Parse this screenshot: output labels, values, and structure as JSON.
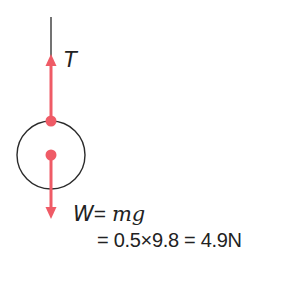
{
  "diagram": {
    "colors": {
      "force": "#ef5b66",
      "outline": "#2b2b2b",
      "text": "#222222"
    },
    "string": {
      "x": 51,
      "y1": 17,
      "y2": 60
    },
    "ball": {
      "cx": 51,
      "cy": 155,
      "r": 34
    },
    "forces": [
      {
        "name": "tension",
        "symbol": "T",
        "from": [
          51,
          121
        ],
        "to": [
          51,
          55
        ],
        "direction": "up"
      },
      {
        "name": "weight",
        "symbol": "W",
        "from": [
          51,
          155
        ],
        "to": [
          51,
          218
        ],
        "direction": "down"
      }
    ],
    "labels": {
      "tension": "T",
      "weight_symbol": "W",
      "weight_eq1": "= ",
      "weight_mg": "mg",
      "weight_eq2": "= 0.5×9.8 = 4.9N"
    }
  }
}
